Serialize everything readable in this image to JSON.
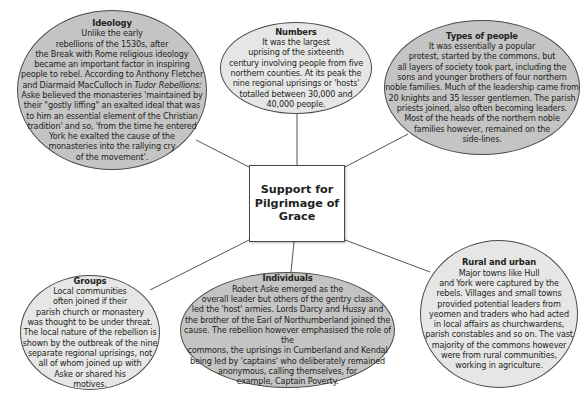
{
  "diagram": {
    "center": {
      "label": "Support for Pilgrimage of Grace",
      "lines": [
        "Support for",
        "Pilgrimage of",
        "Grace"
      ]
    },
    "nodes": [
      {
        "id": "ideology",
        "title": "Ideology",
        "lines": [
          "Unlike the early",
          "rebellions of the 1530s, after",
          "the Break with Rome religious ideology",
          "became an important factor in inspiring",
          "people to rebel. According to Anthony Fletcher",
          "and Diarmaid MacCulloch in",
          "Aske believed the monasteries 'maintained by",
          "their \"gostly liffing\" an exalted ideal that was",
          "to him an essential element of the Christian",
          "tradition' and so, 'from the time he entered",
          "York he exalted the cause of the",
          "monasteries into the rallying cry",
          "of the movement'."
        ],
        "book_title": "Tudor Rebellions:"
      },
      {
        "id": "numbers",
        "title": "Numbers",
        "lines": [
          "It was the largest",
          "uprising of the sixteenth",
          "century involving people from five",
          "northern counties. At its peak the",
          "nine regional uprisings or 'hosts'",
          "totalled between 30,000 and",
          "40,000 people."
        ]
      },
      {
        "id": "types-of-people",
        "title": "Types of people",
        "lines": [
          "It was essentially a popular",
          "protest, started by the commons, but",
          "all layers of society took part, including the",
          "sons and younger brothers of four northern",
          "noble families. Much of the leadership came from",
          "20 knights and 35 lesser gentlemen. The parish",
          "priests joined, also often becoming leaders.",
          "Most of the heads of the northern noble",
          "families however, remained on the",
          "side-lines."
        ]
      },
      {
        "id": "groups",
        "title": "Groups",
        "lines": [
          "Local communities",
          "often joined if their",
          "parish church or monastery",
          "was thought to be under threat.",
          "The local nature of the rebellion is",
          "shown by the outbreak of the nine",
          "separate regional uprisings, not",
          "all of whom joined up with",
          "Aske or shared his",
          "motives."
        ]
      },
      {
        "id": "individuals",
        "title": "Individuals",
        "lines": [
          "Robert Aske emerged as the",
          "overall leader but others of the gentry class",
          "led the 'host' armies. Lords Darcy and Hussy and",
          "the brother of the Earl of Northumberland joined the",
          "cause. The rebellion however emphasised the role of the",
          "commons, the uprisings in Cumberland and Kendal",
          "being led by 'captains' who deliberately remained",
          "anonymous, calling themselves, for",
          "example, Captain Poverty."
        ]
      },
      {
        "id": "rural-and-urban",
        "title": "Rural and urban",
        "lines": [
          "Major towns like Hull",
          "and York were captured by the",
          "rebels. Villages and small towns",
          "provided potential leaders from",
          "yeomen and traders who had acted",
          "in local affairs as churchwardens,",
          "parish constables and so on. The vast",
          "majority of the commons however",
          "were from rural communities,",
          "working in agriculture."
        ]
      }
    ],
    "colors": {
      "light_fill": "#e6e6e6",
      "dark_fill": "#c4c4c4",
      "stroke": "#4a4a4a",
      "background": "#ffffff"
    }
  }
}
